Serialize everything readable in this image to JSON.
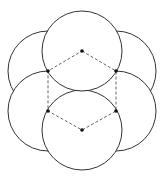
{
  "diagram": {
    "radius": 40,
    "stroke": "#333333",
    "dash_color": "#555555",
    "vertices": [
      {
        "x": 82,
        "y": 51
      },
      {
        "x": 116,
        "y": 71
      },
      {
        "x": 116,
        "y": 111
      },
      {
        "x": 82,
        "y": 130
      },
      {
        "x": 48,
        "y": 111
      },
      {
        "x": 48,
        "y": 71
      }
    ]
  }
}
